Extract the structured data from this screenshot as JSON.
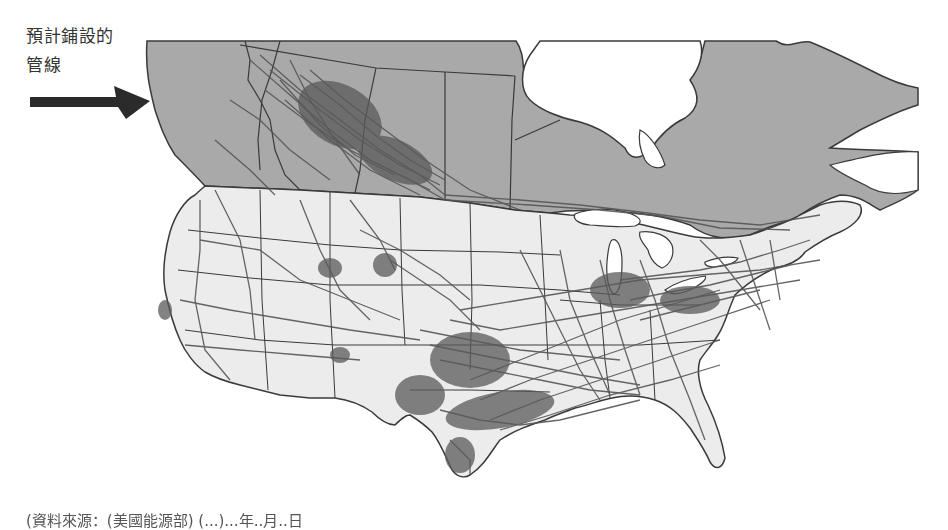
{
  "annotation": {
    "line1": "預計鋪設的",
    "line2": "管線",
    "arrow_icon": "right-arrow-icon",
    "arrow_color": "#2b2b2b"
  },
  "map": {
    "subject": "North American natural gas pipeline network",
    "regions": [
      {
        "name": "Canada",
        "fill": "#a9a9a9"
      },
      {
        "name": "United States",
        "fill": "#ececec"
      }
    ],
    "water_fill": "#ffffff",
    "pipeline_color": "#555555",
    "border_color": "#3a3a3a",
    "dense_areas": [
      "Alberta",
      "Oklahoma / Kansas",
      "Texas Gulf Coast",
      "Louisiana",
      "Ohio Valley / Appalachia",
      "Southern California"
    ]
  },
  "caption": {
    "text": "(資料來源：(美國能源部) (...)...年..月..日",
    "visible_fragments": [
      "年",
      "月",
      "日"
    ],
    "truncated": true
  }
}
